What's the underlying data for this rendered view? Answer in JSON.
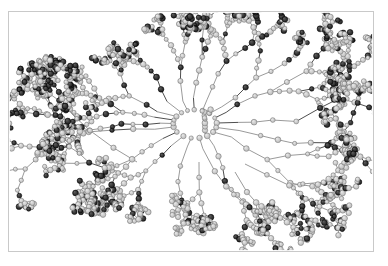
{
  "figure": {
    "kind": "molecular-structure-rendering",
    "title": "",
    "representation": "ball-and-stick",
    "background_color": "#ffffff",
    "frame": {
      "visible": true,
      "color": "#c9c9c9",
      "x": 8,
      "y": 11,
      "width": 366,
      "height": 241
    }
  },
  "render": {
    "canvas_width": 364,
    "canvas_height": 239,
    "center_x": 186,
    "center_y": 112,
    "core_cavity_radius": 42,
    "seed": 20240517,
    "bond": {
      "color": "#8e8e8e",
      "width": 0.9,
      "dark_color": "#3a3a3a"
    },
    "atom_types": [
      {
        "name": "light-atom",
        "fill": "#b9b9b9",
        "highlight": "#e6e6e6",
        "edge": "#6f6f6f",
        "radius": 2.5,
        "fraction": 0.78
      },
      {
        "name": "dark-atom",
        "fill": "#1c1c1c",
        "highlight": "#5a5a5a",
        "edge": "#000000",
        "radius": 2.6,
        "fraction": 0.22
      }
    ],
    "branches": [
      {
        "angle_deg": 268,
        "length": 96,
        "spread": 26,
        "generations": 5,
        "dark_bias": 0.34,
        "weight": 1.05
      },
      {
        "angle_deg": 290,
        "length": 88,
        "spread": 22,
        "generations": 5,
        "dark_bias": 0.3,
        "weight": 0.95
      },
      {
        "angle_deg": 312,
        "length": 104,
        "spread": 24,
        "generations": 5,
        "dark_bias": 0.26,
        "weight": 1.0
      },
      {
        "angle_deg": 335,
        "length": 118,
        "spread": 20,
        "generations": 5,
        "dark_bias": 0.24,
        "weight": 1.1
      },
      {
        "angle_deg": 356,
        "length": 150,
        "spread": 18,
        "generations": 6,
        "dark_bias": 0.3,
        "weight": 1.2
      },
      {
        "angle_deg": 14,
        "length": 146,
        "spread": 20,
        "generations": 6,
        "dark_bias": 0.28,
        "weight": 1.15
      },
      {
        "angle_deg": 34,
        "length": 122,
        "spread": 22,
        "generations": 5,
        "dark_bias": 0.24,
        "weight": 1.05
      },
      {
        "angle_deg": 56,
        "length": 108,
        "spread": 24,
        "generations": 5,
        "dark_bias": 0.22,
        "weight": 1.0
      },
      {
        "angle_deg": 78,
        "length": 96,
        "spread": 26,
        "generations": 5,
        "dark_bias": 0.2,
        "weight": 0.9
      },
      {
        "angle_deg": 100,
        "length": 86,
        "spread": 26,
        "generations": 4,
        "dark_bias": 0.22,
        "weight": 0.85
      },
      {
        "angle_deg": 122,
        "length": 78,
        "spread": 24,
        "generations": 4,
        "dark_bias": 0.2,
        "weight": 0.8
      },
      {
        "angle_deg": 146,
        "length": 92,
        "spread": 24,
        "generations": 5,
        "dark_bias": 0.26,
        "weight": 0.95
      },
      {
        "angle_deg": 168,
        "length": 140,
        "spread": 20,
        "generations": 6,
        "dark_bias": 0.3,
        "weight": 1.1
      },
      {
        "angle_deg": 182,
        "length": 96,
        "spread": 22,
        "generations": 5,
        "dark_bias": 0.32,
        "weight": 1.0
      },
      {
        "angle_deg": 196,
        "length": 88,
        "spread": 24,
        "generations": 5,
        "dark_bias": 0.3,
        "weight": 0.95
      },
      {
        "angle_deg": 212,
        "length": 80,
        "spread": 26,
        "generations": 4,
        "dark_bias": 0.28,
        "weight": 0.9
      },
      {
        "angle_deg": 232,
        "length": 74,
        "spread": 26,
        "generations": 4,
        "dark_bias": 0.3,
        "weight": 0.85
      },
      {
        "angle_deg": 250,
        "length": 80,
        "spread": 26,
        "generations": 4,
        "dark_bias": 0.28,
        "weight": 0.9
      }
    ],
    "satellite_arms": [
      {
        "start_x": 128,
        "start_y": 150,
        "angle_deg": 205,
        "length": 120,
        "generations": 4,
        "dark_bias": 0.3
      },
      {
        "start_x": 112,
        "start_y": 160,
        "angle_deg": 198,
        "length": 96,
        "generations": 3,
        "dark_bias": 0.28
      },
      {
        "start_x": 236,
        "start_y": 152,
        "angle_deg": 35,
        "length": 110,
        "generations": 4,
        "dark_bias": 0.26
      },
      {
        "start_x": 226,
        "start_y": 160,
        "angle_deg": 62,
        "length": 96,
        "generations": 4,
        "dark_bias": 0.22
      },
      {
        "start_x": 190,
        "start_y": 150,
        "angle_deg": 86,
        "length": 72,
        "generations": 3,
        "dark_bias": 0.18
      }
    ],
    "core_stub": {
      "x": 196,
      "y": 100,
      "height": 22,
      "atoms": 6,
      "dark_bias": 0.2
    }
  }
}
